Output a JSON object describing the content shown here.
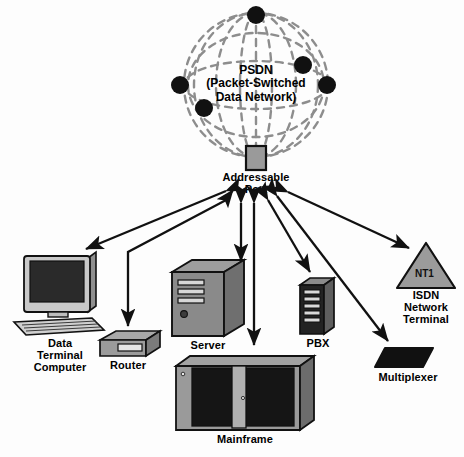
{
  "diagram": {
    "cloud": {
      "name": "psdn-globe",
      "label_line1": "PSDN",
      "label_line2": "(Packet-Switched",
      "label_line3": "Data Network)",
      "label_full": "PSDN\n(Packet-Switched\nData Network)",
      "node_count": 6,
      "nodes": [
        {
          "name": "psdn-node-top",
          "cx": 256,
          "cy": 15,
          "r": 9
        },
        {
          "name": "psdn-node-right-upper",
          "cx": 303,
          "cy": 65,
          "r": 9
        },
        {
          "name": "psdn-node-right",
          "cx": 327,
          "cy": 85,
          "r": 9
        },
        {
          "name": "psdn-node-left",
          "cx": 180,
          "cy": 85,
          "r": 9
        },
        {
          "name": "psdn-node-inner-left",
          "cx": 204,
          "cy": 108,
          "r": 9
        },
        {
          "name": "psdn-node-lower-left",
          "cx": 190,
          "cy": 62,
          "r": 8
        }
      ]
    },
    "port": {
      "name": "addressable-port",
      "label_line1": "Addressable",
      "label_line2": "Port",
      "label_full": "Addressable\nPort",
      "fill": "#9a9a9a"
    },
    "devices": [
      {
        "id": "data-terminal-computer",
        "label": "Data\nTerminal\nComputer",
        "shape": "desktop-computer",
        "link": "bidirectional"
      },
      {
        "id": "router",
        "label": "Router",
        "shape": "flat-box",
        "link": "unidirectional-down"
      },
      {
        "id": "server",
        "label": "Server",
        "shape": "tower-case",
        "link": "bidirectional"
      },
      {
        "id": "mainframe",
        "label": "Mainframe",
        "shape": "wide-cabinet",
        "link": "bidirectional"
      },
      {
        "id": "pbx",
        "label": "PBX",
        "shape": "rack-cabinet",
        "link": "bidirectional"
      },
      {
        "id": "isdn-network-terminal",
        "label": "ISDN\nNetwork\nTerminal",
        "shape": "triangle",
        "badge": "NT1",
        "link": "bidirectional"
      },
      {
        "id": "multiplexer",
        "label": "Multiplexer",
        "shape": "trapezoid",
        "link": "bidirectional"
      }
    ],
    "colors": {
      "ink": "#000000",
      "dash": "#8d8d8d",
      "device_gray": "#9b9b9b",
      "device_dark": "#6d6d6d",
      "panel_black": "#1c1c1c",
      "background": "#fdfdfd"
    }
  }
}
